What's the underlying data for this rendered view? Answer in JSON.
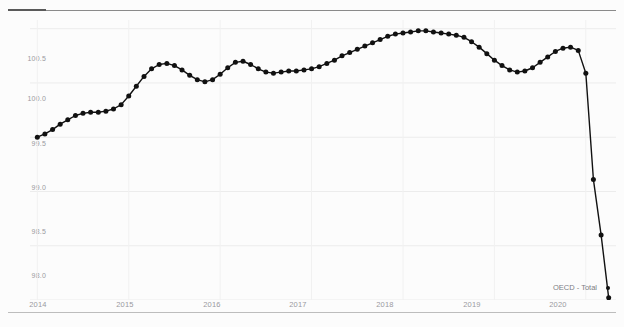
{
  "chart_data": {
    "type": "line",
    "title": "",
    "subtitle": "",
    "xlabel": "",
    "ylabel": "",
    "xlim": [
      2013.92,
      2020.33
    ],
    "ylim": [
      98.0,
      100.58
    ],
    "grid": true,
    "legend_position": "bottom-right",
    "legend": [
      "OECD - Total"
    ],
    "marker": "circle",
    "line_color": "#111111",
    "marker_color": "#111111",
    "y_ticks": [
      "100.5",
      "100.0",
      "99.5",
      "99.0",
      "98.5",
      "98.0"
    ],
    "y_tick_values": [
      100.5,
      100.0,
      99.5,
      99.0,
      98.5,
      98.0
    ],
    "x_ticks": [
      "2014",
      "2015",
      "2016",
      "2017",
      "2018",
      "2019",
      "2020"
    ],
    "x_tick_values": [
      2014,
      2015,
      2016,
      2017,
      2018,
      2019,
      2020
    ],
    "series": [
      {
        "name": "OECD - Total",
        "x": [
          2014.0,
          2014.083,
          2014.167,
          2014.25,
          2014.333,
          2014.417,
          2014.5,
          2014.583,
          2014.667,
          2014.75,
          2014.833,
          2014.917,
          2015.0,
          2015.083,
          2015.167,
          2015.25,
          2015.333,
          2015.417,
          2015.5,
          2015.583,
          2015.667,
          2015.75,
          2015.833,
          2015.917,
          2016.0,
          2016.083,
          2016.167,
          2016.25,
          2016.333,
          2016.417,
          2016.5,
          2016.583,
          2016.667,
          2016.75,
          2016.833,
          2016.917,
          2017.0,
          2017.083,
          2017.167,
          2017.25,
          2017.333,
          2017.417,
          2017.5,
          2017.583,
          2017.667,
          2017.75,
          2017.833,
          2017.917,
          2018.0,
          2018.083,
          2018.167,
          2018.25,
          2018.333,
          2018.417,
          2018.5,
          2018.583,
          2018.667,
          2018.75,
          2018.833,
          2018.917,
          2019.0,
          2019.083,
          2019.167,
          2019.25,
          2019.333,
          2019.417,
          2019.5,
          2019.583,
          2019.667,
          2019.75,
          2019.833,
          2019.917,
          2020.0,
          2020.083,
          2020.167,
          2020.25
        ],
        "values": [
          99.5,
          99.53,
          99.57,
          99.62,
          99.66,
          99.7,
          99.72,
          99.73,
          99.73,
          99.74,
          99.76,
          99.8,
          99.88,
          99.97,
          100.06,
          100.13,
          100.17,
          100.18,
          100.16,
          100.12,
          100.07,
          100.03,
          100.01,
          100.03,
          100.08,
          100.14,
          100.19,
          100.2,
          100.17,
          100.13,
          100.1,
          100.09,
          100.1,
          100.11,
          100.11,
          100.12,
          100.13,
          100.15,
          100.18,
          100.21,
          100.25,
          100.28,
          100.31,
          100.34,
          100.37,
          100.4,
          100.43,
          100.45,
          100.46,
          100.47,
          100.48,
          100.48,
          100.47,
          100.46,
          100.45,
          100.44,
          100.42,
          100.38,
          100.33,
          100.27,
          100.21,
          100.16,
          100.12,
          100.1,
          100.11,
          100.14,
          100.19,
          100.24,
          100.29,
          100.32,
          100.33,
          100.3,
          100.09,
          99.11,
          98.6,
          98.02
        ]
      }
    ],
    "annotations": [
      {
        "text": "OECD - Total",
        "position": "bottom-right",
        "note": "legend label with circular marker"
      }
    ]
  },
  "legend": {
    "label": "OECD - Total"
  },
  "axes": {
    "y_ticks": [
      {
        "label": "100.5"
      },
      {
        "label": "100.0"
      },
      {
        "label": "99.5"
      },
      {
        "label": "99.0"
      },
      {
        "label": "98.5"
      },
      {
        "label": "98.0"
      }
    ],
    "x_ticks": [
      {
        "label": "2014"
      },
      {
        "label": "2015"
      },
      {
        "label": "2016"
      },
      {
        "label": "2017"
      },
      {
        "label": "2018"
      },
      {
        "label": "2019"
      },
      {
        "label": "2020"
      }
    ]
  }
}
